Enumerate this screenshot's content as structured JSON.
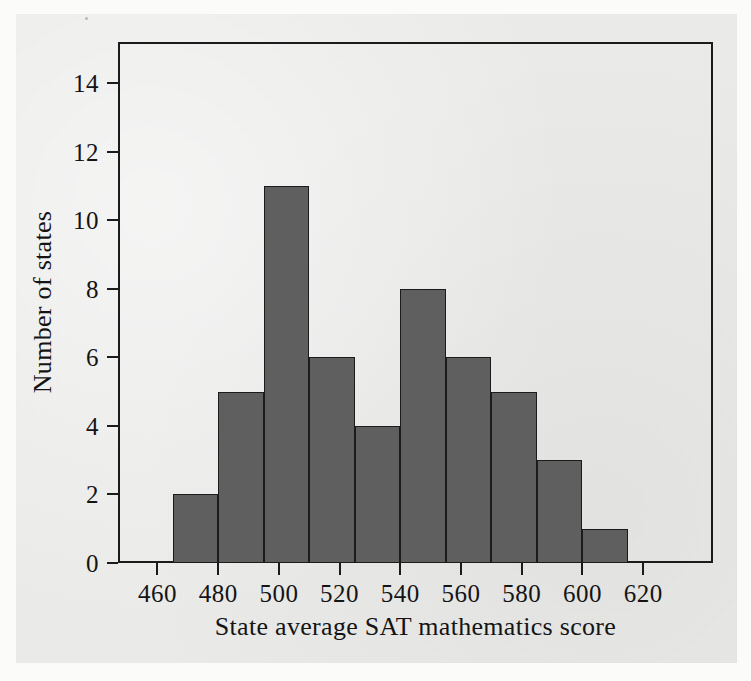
{
  "figure": {
    "background_color": "#ececeb",
    "bar_fill_color": "#5f5f5f",
    "bar_edge_color": "#1b1b1b",
    "axis_color": "#1b1b1b"
  },
  "chart_data": {
    "type": "bar",
    "chart_subtype": "histogram",
    "title": "",
    "xlabel": "State average SAT mathematics score",
    "ylabel": "Number of states",
    "xlim": [
      447,
      643
    ],
    "ylim": [
      0,
      15.2
    ],
    "grid": false,
    "legend": null,
    "bin_width": 15,
    "bin_edges": [
      465,
      480,
      495,
      510,
      525,
      540,
      555,
      570,
      585,
      600,
      615
    ],
    "categories": [
      "465-480",
      "480-495",
      "495-510",
      "510-525",
      "525-540",
      "540-555",
      "555-570",
      "570-585",
      "585-600",
      "600-615"
    ],
    "values": [
      2,
      5,
      11,
      6,
      4,
      8,
      6,
      5,
      3,
      1
    ],
    "total_count": 51,
    "x_ticks": [
      460,
      480,
      500,
      520,
      540,
      560,
      580,
      600,
      620
    ],
    "x_tick_labels": [
      "460",
      "480",
      "500",
      "520",
      "540",
      "560",
      "580",
      "600",
      "620"
    ],
    "y_ticks": [
      0,
      2,
      4,
      6,
      8,
      10,
      12,
      14
    ],
    "y_tick_labels": [
      "0",
      "2",
      "4",
      "6",
      "8",
      "10",
      "12",
      "14"
    ]
  }
}
